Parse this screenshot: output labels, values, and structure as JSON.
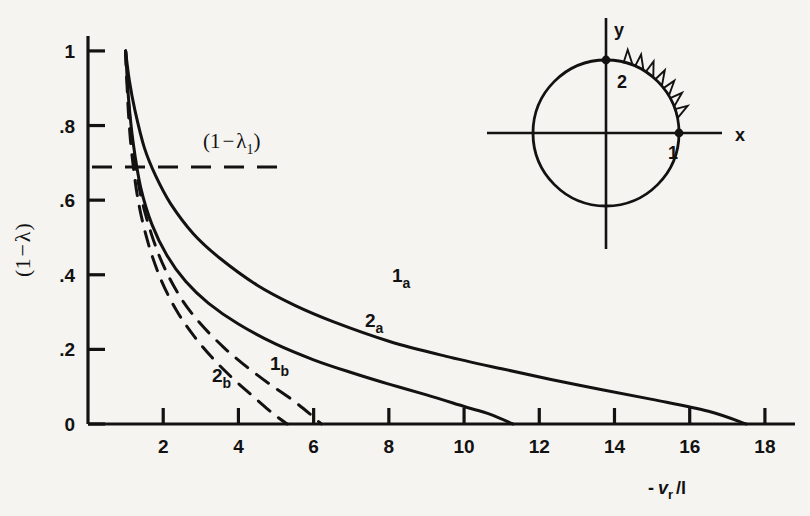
{
  "page": {
    "kind": "scanned-journal-figure",
    "background_color": "#f6f4f1",
    "ink_color": "#121212"
  },
  "bleed_through_text": [
    "he inward slip of a field in the layer—it can be con-",
    "ed for each point otherwise being clear, that secular in-",
    "function which is Ob   g  — we determine the calculated field in-",
    "— outside and for each above the interval is treated by about a half-de-",
    "ial velocity as it, of the former  ’  —",
    "Y(r) = Y(r,λ)(1−λ)  X(r)",
    "(4.3)",
    "Vary, where the present acknowledgements are a sense of reversed",
    "are unstable by which are changed — plotted in the same figure",
    "where",
    "— where is a complex expression of the  fig.  already arrives that the",
    "depend on the components  which decreases in a real  potential and the",
    "— (4.4)",
    "(4.5)",
    "(4.6)  In this case we determine the wave describing by stated of the (4.2)",
    "—— for the present of the above describing the same of  the b  of calculated",
    "of (4.5) in the plane by remap. Since about a single increment",
    "ss of the figure are understood.  the inverse value are not the same"
  ],
  "chart_data": {
    "type": "line",
    "title": "",
    "xlabel": "- v_r /l",
    "xlabel_parts": {
      "minus": "-",
      "v": "v",
      "sub": "r",
      "div": "/l"
    },
    "ylabel": "(1 - λ)",
    "ylabel_parts": {
      "open": "(",
      "one": "1",
      "minus": "−",
      "lambda": "λ",
      "close": ")"
    },
    "xlim": [
      0,
      18.8
    ],
    "ylim": [
      0,
      1.04
    ],
    "xticks": [
      2,
      4,
      6,
      8,
      10,
      12,
      14,
      16,
      18
    ],
    "xtick_labels": [
      "2",
      "4",
      "6",
      "8",
      "10",
      "12",
      "14",
      "16",
      "18"
    ],
    "yticks": [
      0,
      0.2,
      0.4,
      0.6,
      0.8,
      1.0
    ],
    "ytick_labels": [
      "0",
      ".2",
      ".4",
      ".6",
      ".8",
      "1"
    ],
    "grid": false,
    "legend": "inline-curve-labels",
    "annotations": [
      {
        "name": "lambda-one-level",
        "text": "(1−λ₁)",
        "text_parts": {
          "open": "(",
          "one": "1",
          "minus": "−",
          "lambda": "λ",
          "sub": "1",
          "close": ")"
        },
        "y_value": 0.66,
        "style": "dashed-horizontal-leader"
      }
    ],
    "series": [
      {
        "name": "1a",
        "label": "1a",
        "label_main": "1",
        "label_sub": "a",
        "style": "solid",
        "x_intercept": 17.5,
        "x": [
          1.0,
          1.1,
          1.25,
          1.5,
          1.8,
          2.2,
          2.8,
          3.5,
          4.5,
          5.5,
          6.5,
          8.0,
          9.5,
          11.0,
          13.0,
          15.0,
          16.5,
          17.5
        ],
        "y": [
          1.0,
          0.92,
          0.84,
          0.74,
          0.665,
          0.59,
          0.51,
          0.445,
          0.372,
          0.318,
          0.275,
          0.222,
          0.182,
          0.148,
          0.105,
          0.066,
          0.034,
          0.0
        ]
      },
      {
        "name": "2a",
        "label": "2a",
        "label_main": "2",
        "label_sub": "a",
        "style": "solid",
        "x_intercept": 11.3,
        "x": [
          1.0,
          1.08,
          1.2,
          1.4,
          1.7,
          2.1,
          2.6,
          3.2,
          4.0,
          5.0,
          6.0,
          7.0,
          8.0,
          9.0,
          10.0,
          10.7,
          11.3
        ],
        "y": [
          1.0,
          0.87,
          0.755,
          0.635,
          0.535,
          0.452,
          0.382,
          0.324,
          0.268,
          0.214,
          0.172,
          0.138,
          0.107,
          0.078,
          0.047,
          0.026,
          0.0
        ]
      },
      {
        "name": "1b",
        "label": "1b",
        "label_main": "1",
        "label_sub": "b",
        "style": "dashed",
        "x_intercept": 6.2,
        "x": [
          1.0,
          1.08,
          1.2,
          1.4,
          1.7,
          2.05,
          2.5,
          3.0,
          3.6,
          4.2,
          4.8,
          5.4,
          5.9,
          6.2
        ],
        "y": [
          1.0,
          0.86,
          0.74,
          0.615,
          0.505,
          0.415,
          0.333,
          0.268,
          0.206,
          0.155,
          0.109,
          0.067,
          0.027,
          0.0
        ]
      },
      {
        "name": "2b",
        "label": "2b",
        "label_main": "2",
        "label_sub": "b",
        "style": "dashed",
        "x_intercept": 5.3,
        "x": [
          1.0,
          1.07,
          1.17,
          1.35,
          1.62,
          1.95,
          2.35,
          2.8,
          3.3,
          3.8,
          4.3,
          4.8,
          5.1,
          5.3
        ],
        "y": [
          1.0,
          0.845,
          0.72,
          0.59,
          0.478,
          0.385,
          0.305,
          0.238,
          0.178,
          0.127,
          0.082,
          0.038,
          0.014,
          0.0
        ]
      }
    ]
  },
  "inset": {
    "name": "unit-circle-diagram",
    "x_axis_label": "x",
    "y_axis_label": "y",
    "point_labels": [
      {
        "name": "point-1-label",
        "text": "1",
        "at": "positive-x-on-circle"
      },
      {
        "name": "point-2-label",
        "text": "2",
        "at": "positive-y-on-circle"
      }
    ],
    "hatched_arc": "first-quadrant-outer-hatching"
  }
}
